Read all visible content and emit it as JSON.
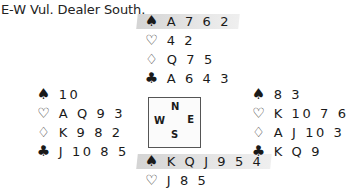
{
  "title": "E-W Vul. Dealer South.",
  "compass": {
    "north": "N",
    "west": "W",
    "east": "E",
    "south": "S"
  },
  "suit_symbols": {
    "spades": "♠",
    "hearts": "♡",
    "diamonds": "♢",
    "clubs": "♣"
  },
  "hands": {
    "north": {
      "spades": "A 7 6 2",
      "hearts": "4 2",
      "diamonds": "Q 7 5",
      "clubs": "A 6 4 3",
      "highlighted_suit": "spades"
    },
    "west": {
      "spades": "10",
      "hearts": "A Q 9 3",
      "diamonds": "K 9 8 2",
      "clubs": "J 10 8 5"
    },
    "east": {
      "spades": "8 3",
      "hearts": "K 10 7 6",
      "diamonds": "A J 10 3",
      "clubs": "K Q 9"
    },
    "south": {
      "spades": "K Q J 9 5 4",
      "hearts": "J 8 5",
      "highlighted_suit": "spades"
    }
  },
  "colors": {
    "highlight": "#d9d9d9",
    "text": "#1a1a1a",
    "compass_border": "#555555"
  }
}
